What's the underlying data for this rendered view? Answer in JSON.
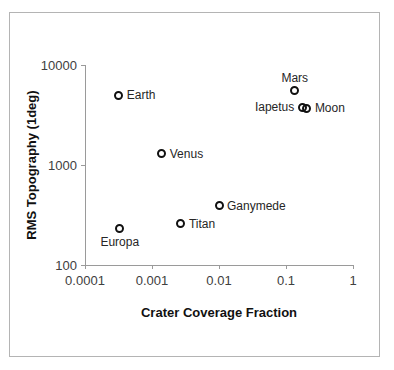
{
  "chart_data": {
    "type": "scatter",
    "title": "",
    "xlabel": "Crater Coverage Fraction",
    "ylabel": "RMS Topography (1deg)",
    "xscale": "log",
    "yscale": "log",
    "xlim": [
      0.0001,
      1
    ],
    "ylim": [
      100,
      10000
    ],
    "grid": false,
    "legend": "none",
    "xticks": [
      "0.0001",
      "0.001",
      "0.01",
      "0.1",
      "1"
    ],
    "xtick_values": [
      0.0001,
      0.001,
      0.01,
      0.1,
      1
    ],
    "yticks": [
      "100",
      "1000",
      "10000"
    ],
    "ytick_values": [
      100,
      1000,
      10000
    ],
    "points": [
      {
        "name": "Earth",
        "x": 0.00032,
        "y": 5000,
        "label_pos": "right"
      },
      {
        "name": "Venus",
        "x": 0.0014,
        "y": 1300,
        "label_pos": "right"
      },
      {
        "name": "Europa",
        "x": 0.00033,
        "y": 230,
        "label_pos": "below"
      },
      {
        "name": "Titan",
        "x": 0.0027,
        "y": 260,
        "label_pos": "right"
      },
      {
        "name": "Ganymede",
        "x": 0.01,
        "y": 390,
        "label_pos": "right"
      },
      {
        "name": "Mars",
        "x": 0.135,
        "y": 5500,
        "label_pos": "above"
      },
      {
        "name": "Iapetus",
        "x": 0.175,
        "y": 3800,
        "label_pos": "left"
      },
      {
        "name": "Moon",
        "x": 0.205,
        "y": 3700,
        "label_pos": "right"
      }
    ]
  },
  "style": {
    "marker_color": "#111111",
    "axis_color": "#9a9a9a",
    "text_color": "#262626",
    "border_color": "#b4b4b4",
    "background": "#ffffff"
  }
}
